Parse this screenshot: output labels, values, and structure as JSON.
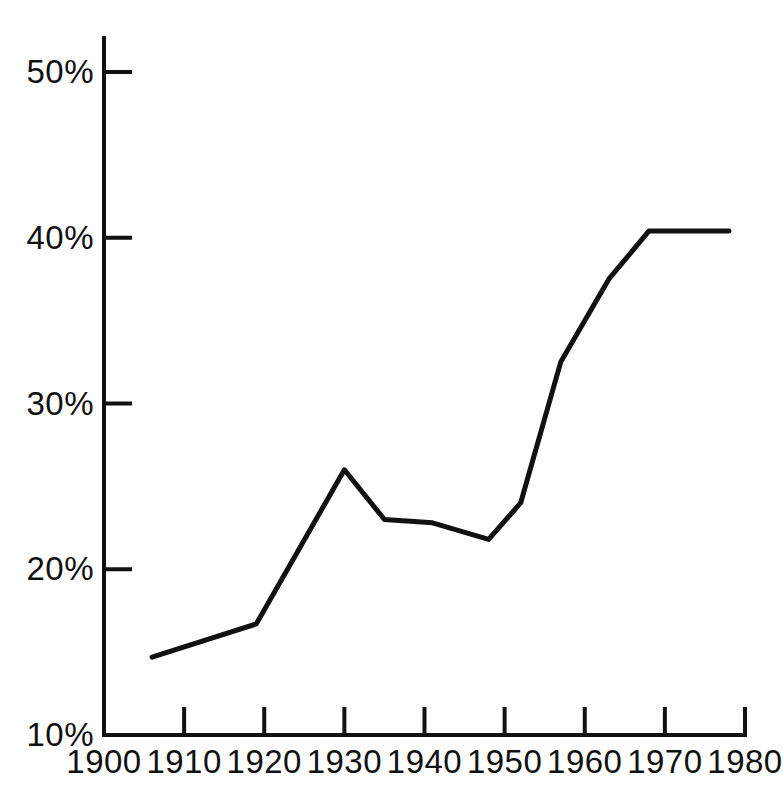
{
  "chart_data": {
    "type": "line",
    "title": "",
    "subtitle": "",
    "xlabel": "",
    "ylabel": "",
    "xlim": [
      1900,
      1980
    ],
    "ylim": [
      10,
      50
    ],
    "grid": false,
    "legend": null,
    "legend_position": "none",
    "x_tick_labels": [
      "1900",
      "1910",
      "1920",
      "1930",
      "1940",
      "1950",
      "1960",
      "1970",
      "1980"
    ],
    "x_ticks": [
      1900,
      1910,
      1920,
      1930,
      1940,
      1950,
      1960,
      1970,
      1980
    ],
    "y_tick_labels": [
      "10%",
      "20%",
      "30%",
      "40%",
      "50%"
    ],
    "y_ticks": [
      10,
      20,
      30,
      40,
      50
    ],
    "y_unit": "%",
    "series": [
      {
        "name": "series-1",
        "color": "#111111",
        "line_width": 5,
        "x": [
          1906,
          1919,
          1930,
          1935,
          1941,
          1948,
          1952,
          1957,
          1963,
          1968,
          1978
        ],
        "values": [
          14.7,
          16.7,
          26.0,
          23.0,
          22.8,
          21.8,
          24.0,
          32.5,
          37.5,
          40.4,
          40.4
        ]
      }
    ],
    "annotations": []
  },
  "axis": {
    "x_axis_name": "x-axis",
    "y_axis_name": "y-axis",
    "tick_color": "#111111"
  }
}
